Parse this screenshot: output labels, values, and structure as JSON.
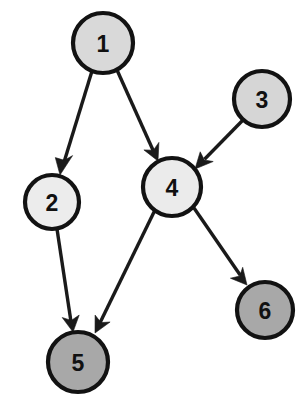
{
  "diagram": {
    "type": "directed-graph",
    "background_color": "#ffffff",
    "canvas": {
      "width": 306,
      "height": 414
    },
    "edge_color": "#1a1a1a",
    "node_stroke_color": "#121212",
    "label_color": "#111111",
    "nodes": [
      {
        "id": "1",
        "label": "1",
        "cx": 103,
        "cy": 43,
        "r": 30,
        "fill": "#d9d9d9",
        "shade": "light-gray"
      },
      {
        "id": "2",
        "label": "2",
        "cx": 52,
        "cy": 202,
        "r": 27,
        "fill": "#ececec",
        "shade": "very-light-gray"
      },
      {
        "id": "3",
        "label": "3",
        "cx": 262,
        "cy": 99,
        "r": 28,
        "fill": "#d6d6d6",
        "shade": "light-gray"
      },
      {
        "id": "4",
        "label": "4",
        "cx": 172,
        "cy": 187,
        "r": 29,
        "fill": "#ebebeb",
        "shade": "very-light-gray"
      },
      {
        "id": "5",
        "label": "5",
        "cx": 78,
        "cy": 362,
        "r": 30,
        "fill": "#a8a8a8",
        "shade": "medium-gray"
      },
      {
        "id": "6",
        "label": "6",
        "cx": 265,
        "cy": 310,
        "r": 28,
        "fill": "#a8a8a8",
        "shade": "medium-gray"
      }
    ],
    "edges": [
      {
        "id": "e1",
        "from": "1",
        "to": "2",
        "directed": true,
        "x1": 92,
        "y1": 71,
        "x2": 60,
        "y2": 173
      },
      {
        "id": "e2",
        "from": "1",
        "to": "4",
        "directed": true,
        "x1": 117,
        "y1": 70,
        "x2": 158,
        "y2": 161
      },
      {
        "id": "e3",
        "from": "3",
        "to": "4",
        "directed": true,
        "x1": 243,
        "y1": 120,
        "x2": 195,
        "y2": 169
      },
      {
        "id": "e4",
        "from": "2",
        "to": "5",
        "directed": true,
        "x1": 57,
        "y1": 229,
        "x2": 73,
        "y2": 331
      },
      {
        "id": "e5",
        "from": "4",
        "to": "5",
        "directed": true,
        "x1": 155,
        "y1": 210,
        "x2": 95,
        "y2": 333
      },
      {
        "id": "e6",
        "from": "4",
        "to": "6",
        "directed": true,
        "x1": 194,
        "y1": 208,
        "x2": 247,
        "y2": 285
      }
    ]
  }
}
